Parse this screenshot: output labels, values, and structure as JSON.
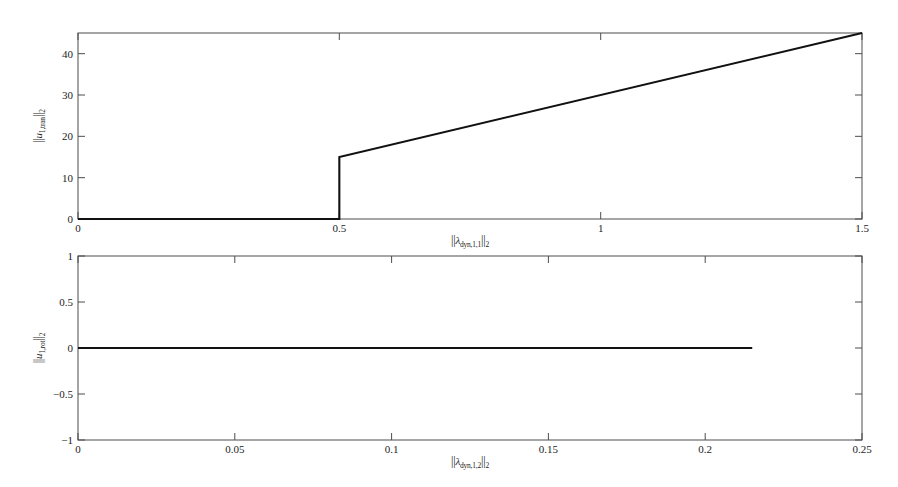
{
  "chart_data": [
    {
      "type": "line",
      "panel": "top",
      "title": "",
      "xlabel": "||λ_dyn,1,1||_2",
      "ylabel": "||u_1,tran||_2",
      "xlim": [
        0,
        1.5
      ],
      "ylim": [
        0,
        45
      ],
      "xticks": [
        0,
        0.5,
        1,
        1.5
      ],
      "xtick_labels": [
        "0",
        "0.5",
        "1",
        "1.5"
      ],
      "yticks": [
        0,
        10,
        20,
        30,
        40
      ],
      "ytick_labels": [
        "0",
        "10",
        "20",
        "30",
        "40"
      ],
      "grid": false,
      "legend": null,
      "series": [
        {
          "name": "||u_1,tran||_2",
          "x": [
            0,
            0.5,
            0.5,
            1.5
          ],
          "values": [
            0,
            0,
            15,
            45
          ]
        }
      ],
      "annotations": [
        "flat at 0 from x=0 to x=0.5",
        "vertical jump discontinuity at x=0.5 from 0 to 15",
        "linear increase from (0.5, 15) to (1.5, 45)"
      ]
    },
    {
      "type": "line",
      "panel": "bottom",
      "title": "",
      "xlabel": "||λ_dyn,1,2||_2",
      "ylabel": "||u_1,rot||_2",
      "xlim": [
        0,
        0.25
      ],
      "ylim": [
        -1,
        1
      ],
      "xticks": [
        0,
        0.05,
        0.1,
        0.15,
        0.2,
        0.25
      ],
      "xtick_labels": [
        "0",
        "0.05",
        "0.1",
        "0.15",
        "0.2",
        "0.25"
      ],
      "yticks": [
        -1,
        -0.5,
        0,
        0.5,
        1
      ],
      "ytick_labels": [
        "-1",
        "-0.5",
        "0",
        "0.5",
        "1"
      ],
      "grid": false,
      "legend": null,
      "series": [
        {
          "name": "||u_1,rot||_2",
          "x": [
            0,
            0.215
          ],
          "values": [
            0,
            0
          ]
        }
      ],
      "annotations": [
        "constant at 0 from x=0 to x=0.215"
      ]
    }
  ],
  "top_panel": {
    "ylabel_parts": {
      "norm_open": "||",
      "var": "u",
      "sub": "1,tran",
      "norm_close": "||",
      "order": "2"
    },
    "xlabel_parts": {
      "norm_open": "||",
      "var": "λ",
      "sub": "dyn,1,1",
      "norm_close": "||",
      "order": "2"
    },
    "xtick_labels": [
      "0",
      "0.5",
      "1",
      "1.5"
    ],
    "ytick_labels": [
      "0",
      "10",
      "20",
      "30",
      "40"
    ]
  },
  "bottom_panel": {
    "ylabel_parts": {
      "norm_open": "||",
      "var": "u",
      "sub": "1,rot",
      "norm_close": "||",
      "order": "2"
    },
    "xlabel_parts": {
      "norm_open": "||",
      "var": "λ",
      "sub": "dyn,1,2",
      "norm_close": "||",
      "order": "2"
    },
    "xtick_labels": [
      "0",
      "0.05",
      "0.1",
      "0.15",
      "0.2",
      "0.25"
    ],
    "ytick_labels": [
      "1",
      "0.5",
      "0",
      "−0.5",
      "−1"
    ]
  },
  "colors": {
    "background": "#ffffff",
    "axis": "#4d4d4d",
    "data_line": "#111111",
    "text": "#1c1c1c"
  }
}
